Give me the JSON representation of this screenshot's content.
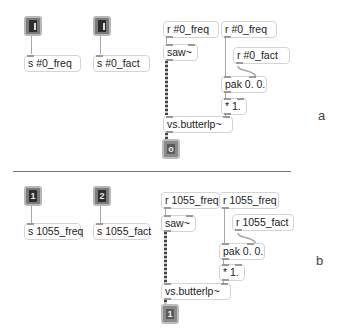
{
  "panels": [
    {
      "label": "a",
      "inlets": [
        {
          "glyph": ""
        },
        {
          "glyph": ""
        }
      ],
      "send_freq": "s #0_freq",
      "send_fact": "s #0_fact",
      "recv_freq_1": "r #0_freq",
      "recv_freq_2": "r #0_freq",
      "recv_fact": "r #0_fact",
      "saw": "saw~",
      "pak": "pak 0. 0.",
      "mult": "* 1.",
      "filter": "vs.butterlp~",
      "outlet": {
        "glyph": "o"
      }
    },
    {
      "label": "b",
      "inlets": [
        {
          "glyph": "1"
        },
        {
          "glyph": "2"
        }
      ],
      "send_freq": "s 1055_freq",
      "send_fact": "s 1055_fact",
      "recv_freq_1": "r 1055_freq",
      "recv_freq_2": "r 1055_freq",
      "recv_fact": "r 1055_fact",
      "saw": "saw~",
      "pak": "pak 0. 0.",
      "mult": "* 1.",
      "filter": "vs.butterlp~",
      "outlet": {
        "glyph": "1"
      }
    }
  ]
}
